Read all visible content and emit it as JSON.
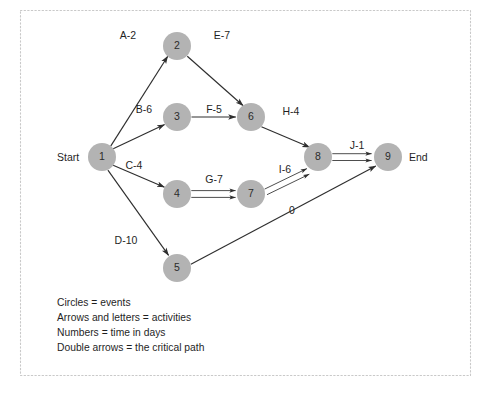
{
  "diagram": {
    "colors": {
      "node_fill": "#b3b3b3",
      "edge": "#2e2e2e",
      "frame": "#c9c9c9",
      "text": "#1f1f1f",
      "background": "#ffffff"
    },
    "terminals": {
      "start_label": "Start",
      "end_label": "End"
    },
    "nodes": [
      {
        "id": "1",
        "label": "1",
        "x": 102,
        "y": 157,
        "r": 14
      },
      {
        "id": "2",
        "label": "2",
        "x": 177,
        "y": 46,
        "r": 14
      },
      {
        "id": "3",
        "label": "3",
        "x": 177,
        "y": 117,
        "r": 14
      },
      {
        "id": "4",
        "label": "4",
        "x": 177,
        "y": 194,
        "r": 14
      },
      {
        "id": "5",
        "label": "5",
        "x": 177,
        "y": 268,
        "r": 14
      },
      {
        "id": "6",
        "label": "6",
        "x": 251,
        "y": 117,
        "r": 14
      },
      {
        "id": "7",
        "label": "7",
        "x": 251,
        "y": 194,
        "r": 14
      },
      {
        "id": "8",
        "label": "8",
        "x": 318,
        "y": 157,
        "r": 14
      },
      {
        "id": "9",
        "label": "9",
        "x": 388,
        "y": 157,
        "r": 14
      }
    ],
    "edges": [
      {
        "id": "A",
        "from": "1",
        "to": "2",
        "label": "A-2",
        "activity": "A",
        "duration": 2,
        "critical": false,
        "label_x": 128,
        "label_y": 36
      },
      {
        "id": "B",
        "from": "1",
        "to": "3",
        "label": "B-6",
        "activity": "B",
        "duration": 6,
        "critical": false,
        "label_x": 144,
        "label_y": 110
      },
      {
        "id": "C",
        "from": "1",
        "to": "4",
        "label": "C-4",
        "activity": "C",
        "duration": 4,
        "critical": false,
        "label_x": 134,
        "label_y": 166
      },
      {
        "id": "D",
        "from": "1",
        "to": "5",
        "label": "D-10",
        "activity": "D",
        "duration": 10,
        "critical": false,
        "label_x": 126,
        "label_y": 241
      },
      {
        "id": "E",
        "from": "2",
        "to": "6",
        "label": "E-7",
        "activity": "E",
        "duration": 7,
        "critical": false,
        "label_x": 222,
        "label_y": 36
      },
      {
        "id": "F",
        "from": "3",
        "to": "6",
        "label": "F-5",
        "activity": "F",
        "duration": 5,
        "critical": false,
        "label_x": 214,
        "label_y": 110
      },
      {
        "id": "G",
        "from": "4",
        "to": "7",
        "label": "G-7",
        "activity": "G",
        "duration": 7,
        "critical": true,
        "label_x": 214,
        "label_y": 180
      },
      {
        "id": "H",
        "from": "6",
        "to": "8",
        "label": "H-4",
        "activity": "H",
        "duration": 4,
        "critical": false,
        "label_x": 291,
        "label_y": 112
      },
      {
        "id": "I",
        "from": "7",
        "to": "8",
        "label": "I-6",
        "activity": "I",
        "duration": 6,
        "critical": true,
        "label_x": 285,
        "label_y": 170
      },
      {
        "id": "J",
        "from": "8",
        "to": "9",
        "label": "J-1",
        "activity": "J",
        "duration": 1,
        "critical": true,
        "label_x": 357,
        "label_y": 146
      },
      {
        "id": "dummy",
        "from": "5",
        "to": "9",
        "label": "0",
        "activity": "",
        "duration": 0,
        "critical": false,
        "label_x": 292,
        "label_y": 211
      }
    ],
    "legend": [
      "Circles = events",
      "Arrows and letters = activities",
      "Numbers = time in days",
      "Double arrows = the critical path"
    ]
  }
}
